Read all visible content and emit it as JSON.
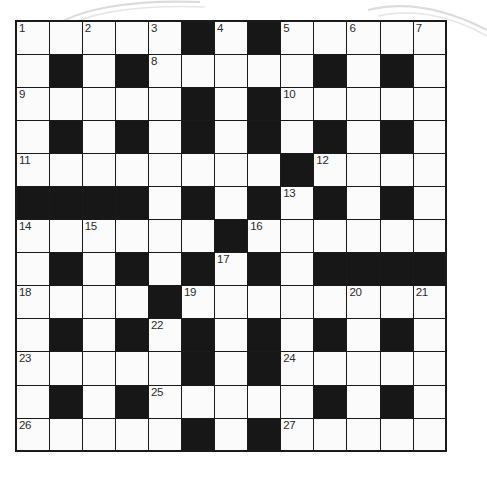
{
  "puzzle": {
    "title": "Crossword Grid",
    "rows": 13,
    "columns": 13,
    "cell_size_px": 33,
    "colors": {
      "block": "#171717",
      "cell": "#fbfbfb",
      "border": "#1a1a1a",
      "number_text": "#2b2b2b",
      "background": "#ffffff",
      "decoration": "#d9d9d9"
    },
    "legend": {
      "1": "white = fillable cell",
      "0": "black = blocked cell"
    },
    "grid": [
      [
        1,
        1,
        1,
        1,
        1,
        0,
        1,
        0,
        1,
        1,
        1,
        1,
        1
      ],
      [
        1,
        0,
        1,
        0,
        1,
        1,
        1,
        1,
        1,
        0,
        1,
        0,
        1
      ],
      [
        1,
        1,
        1,
        1,
        1,
        0,
        1,
        0,
        1,
        1,
        1,
        1,
        1
      ],
      [
        1,
        0,
        1,
        0,
        1,
        0,
        1,
        0,
        1,
        0,
        1,
        0,
        1
      ],
      [
        1,
        1,
        1,
        1,
        1,
        1,
        1,
        1,
        0,
        1,
        1,
        1,
        1
      ],
      [
        0,
        0,
        0,
        0,
        1,
        0,
        1,
        0,
        1,
        0,
        1,
        0,
        1
      ],
      [
        1,
        1,
        1,
        1,
        1,
        1,
        0,
        1,
        1,
        1,
        1,
        1,
        1
      ],
      [
        1,
        0,
        1,
        0,
        1,
        0,
        1,
        0,
        1,
        0,
        0,
        0,
        0
      ],
      [
        1,
        1,
        1,
        1,
        0,
        1,
        1,
        1,
        1,
        1,
        1,
        1,
        1
      ],
      [
        1,
        0,
        1,
        0,
        1,
        0,
        1,
        0,
        1,
        0,
        1,
        0,
        1
      ],
      [
        1,
        1,
        1,
        1,
        1,
        0,
        1,
        0,
        1,
        1,
        1,
        1,
        1
      ],
      [
        1,
        0,
        1,
        0,
        1,
        1,
        1,
        1,
        1,
        0,
        1,
        0,
        1
      ],
      [
        1,
        1,
        1,
        1,
        1,
        0,
        1,
        0,
        1,
        1,
        1,
        1,
        1
      ]
    ],
    "numbers": [
      {
        "number": "1",
        "row": 0,
        "col": 0
      },
      {
        "number": "2",
        "row": 0,
        "col": 2
      },
      {
        "number": "3",
        "row": 0,
        "col": 4
      },
      {
        "number": "4",
        "row": 0,
        "col": 6
      },
      {
        "number": "5",
        "row": 0,
        "col": 8
      },
      {
        "number": "6",
        "row": 0,
        "col": 10
      },
      {
        "number": "7",
        "row": 0,
        "col": 12
      },
      {
        "number": "8",
        "row": 1,
        "col": 4
      },
      {
        "number": "9",
        "row": 2,
        "col": 0
      },
      {
        "number": "10",
        "row": 2,
        "col": 8
      },
      {
        "number": "11",
        "row": 4,
        "col": 0
      },
      {
        "number": "12",
        "row": 4,
        "col": 9
      },
      {
        "number": "13",
        "row": 5,
        "col": 8
      },
      {
        "number": "14",
        "row": 6,
        "col": 0
      },
      {
        "number": "15",
        "row": 6,
        "col": 2
      },
      {
        "number": "16",
        "row": 6,
        "col": 7
      },
      {
        "number": "17",
        "row": 7,
        "col": 6
      },
      {
        "number": "18",
        "row": 8,
        "col": 0
      },
      {
        "number": "19",
        "row": 8,
        "col": 5
      },
      {
        "number": "20",
        "row": 8,
        "col": 10
      },
      {
        "number": "21",
        "row": 8,
        "col": 12
      },
      {
        "number": "22",
        "row": 9,
        "col": 4
      },
      {
        "number": "23",
        "row": 10,
        "col": 0
      },
      {
        "number": "24",
        "row": 10,
        "col": 8
      },
      {
        "number": "25",
        "row": 11,
        "col": 4
      },
      {
        "number": "26",
        "row": 12,
        "col": 0
      },
      {
        "number": "27",
        "row": 12,
        "col": 8
      }
    ]
  }
}
